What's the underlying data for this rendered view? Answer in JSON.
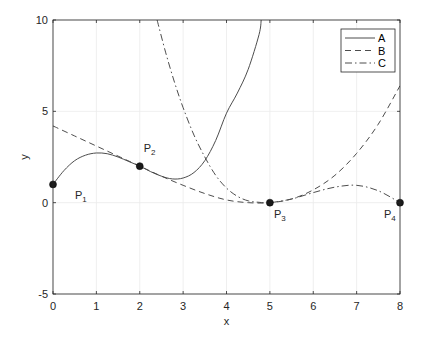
{
  "chart_data": {
    "type": "line",
    "title": "",
    "xlabel": "x",
    "ylabel": "y",
    "xlim": [
      0,
      8
    ],
    "ylim": [
      -5,
      10
    ],
    "xticks": [
      0,
      1,
      2,
      3,
      4,
      5,
      6,
      7,
      8
    ],
    "yticks": [
      -5,
      0,
      5,
      10
    ],
    "grid": true,
    "legend_position": "top-right",
    "series": [
      {
        "name": "A",
        "style": "solid",
        "x": [
          0,
          0.25,
          0.5,
          0.75,
          1.0,
          1.25,
          1.5,
          1.75,
          2.0,
          2.25,
          2.5,
          2.75,
          3.0,
          3.25,
          3.5,
          3.75,
          4.0,
          4.25,
          4.5,
          4.75,
          4.8
        ],
        "y": [
          1.0,
          1.75,
          2.3,
          2.6,
          2.72,
          2.68,
          2.5,
          2.25,
          2.0,
          1.7,
          1.45,
          1.3,
          1.35,
          1.65,
          2.3,
          3.4,
          4.9,
          6.0,
          7.3,
          9.2,
          10.0
        ]
      },
      {
        "name": "B",
        "style": "dashed",
        "x": [
          0,
          0.5,
          1.0,
          1.5,
          2.0,
          2.5,
          3.0,
          3.5,
          4.0,
          4.5,
          5.0,
          5.5,
          6.0,
          6.5,
          7.0,
          7.5,
          8.0
        ],
        "y": [
          4.2,
          3.65,
          3.1,
          2.55,
          2.0,
          1.45,
          0.95,
          0.5,
          0.15,
          0.0,
          0.0,
          0.2,
          0.7,
          1.5,
          2.7,
          4.3,
          6.4
        ]
      },
      {
        "name": "C",
        "style": "dash-dot",
        "x": [
          2.4,
          2.6,
          2.8,
          3.0,
          3.25,
          3.5,
          3.75,
          4.0,
          4.25,
          4.5,
          4.75,
          5.0,
          5.5,
          6.0,
          6.5,
          7.0,
          7.5,
          8.0
        ],
        "y": [
          10.0,
          8.2,
          6.6,
          5.2,
          3.7,
          2.5,
          1.5,
          0.8,
          0.35,
          0.1,
          0.02,
          0.0,
          0.2,
          0.55,
          0.85,
          0.95,
          0.65,
          0.0
        ]
      }
    ],
    "points": [
      {
        "label": "P",
        "sub": "1",
        "x": 0,
        "y": 1
      },
      {
        "label": "P",
        "sub": "2",
        "x": 2,
        "y": 2
      },
      {
        "label": "P",
        "sub": "3",
        "x": 5,
        "y": 0
      },
      {
        "label": "P",
        "sub": "4",
        "x": 8,
        "y": 0
      }
    ],
    "colors": {
      "line": "#4d4d4d",
      "axis": "#262626",
      "grid": "#ebebeb",
      "marker": "#1a1a1a"
    }
  }
}
